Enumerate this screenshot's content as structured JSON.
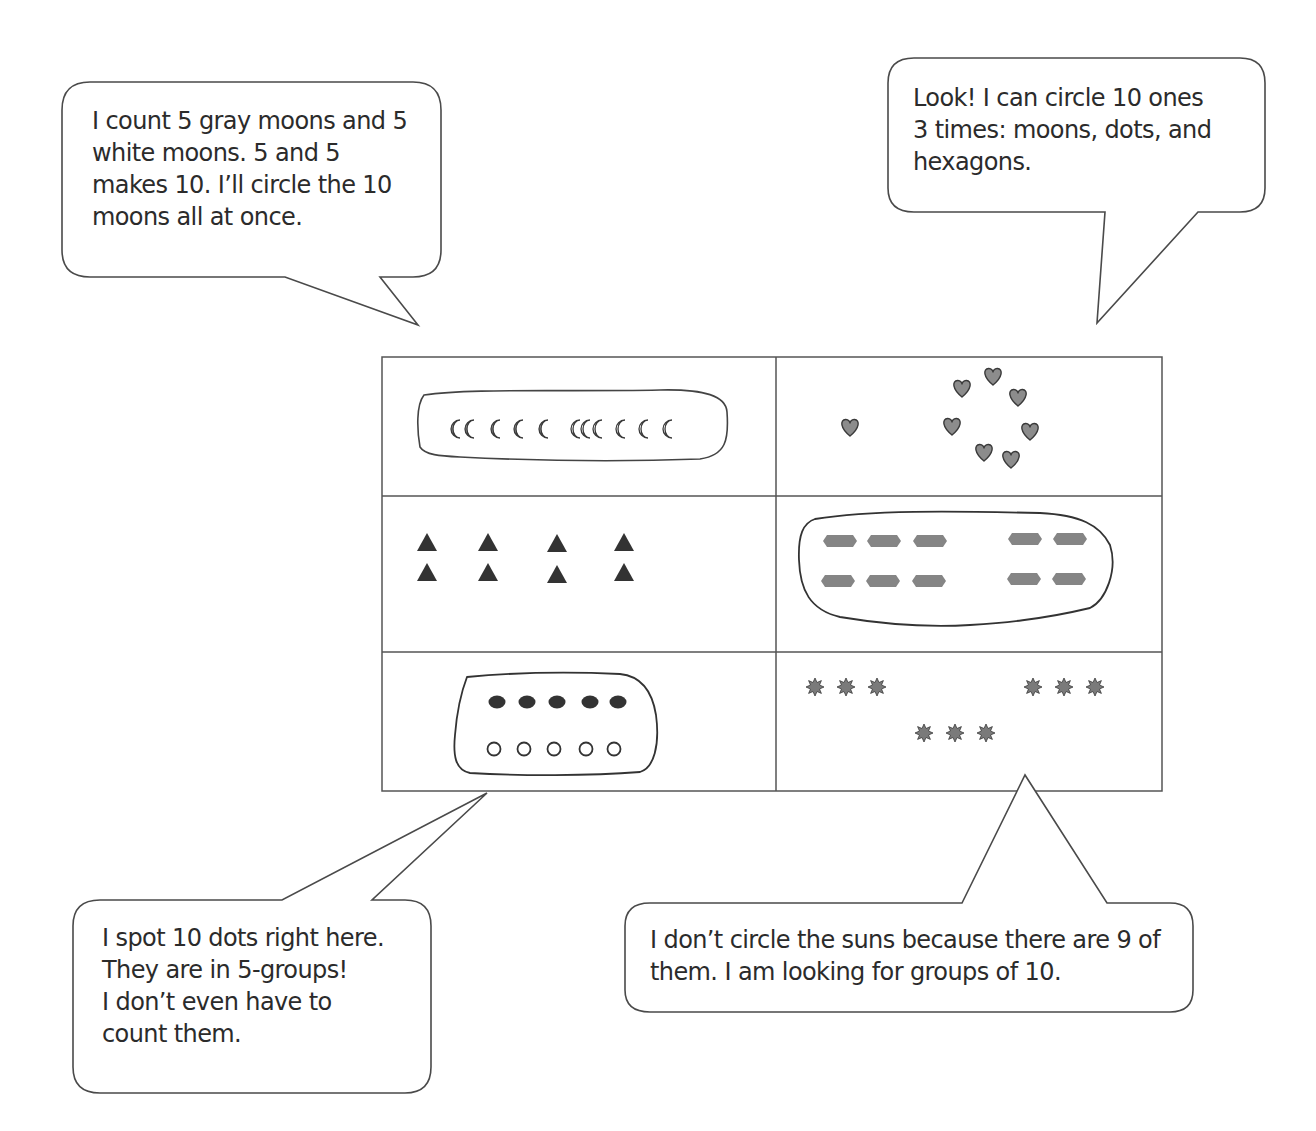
{
  "bubbles": {
    "top_left": {
      "lines": [
        "I count 5 gray moons and 5",
        "white moons.  5 and 5",
        "makes 10.  I’ll circle the 10",
        "moons all at once."
      ]
    },
    "top_right": {
      "lines": [
        "Look!  I can circle 10 ones",
        "3 times:  moons, dots, and",
        "hexagons."
      ]
    },
    "bottom_left": {
      "lines": [
        "I spot 10 dots right here.",
        "They are in 5-groups!",
        "I don’t even have to",
        "count them."
      ]
    },
    "bottom_right": {
      "lines": [
        "I don’t circle the suns because there are 9 of",
        "them.  I am looking for groups of 10."
      ]
    }
  },
  "grid": {
    "cells": [
      {
        "id": "moons",
        "shape": "moon-icon",
        "count": 10,
        "detail": "5 gray moons, 5 white moons",
        "circled": true
      },
      {
        "id": "hearts",
        "shape": "heart-icon",
        "count": 8,
        "circled": false
      },
      {
        "id": "triangles",
        "shape": "triangle-icon",
        "count": 8,
        "circled": false
      },
      {
        "id": "hexagons",
        "shape": "hexagon-icon",
        "count": 10,
        "circled": true
      },
      {
        "id": "dots",
        "shape": "dot-icon",
        "count": 10,
        "detail": "5 filled dots, 5 open dots",
        "circled": true
      },
      {
        "id": "suns",
        "shape": "sun-icon",
        "count": 9,
        "circled": false
      }
    ]
  },
  "colors": {
    "line": "#4a4a4a",
    "gray_fill": "#8a8a8a",
    "dark_fill": "#333333"
  }
}
